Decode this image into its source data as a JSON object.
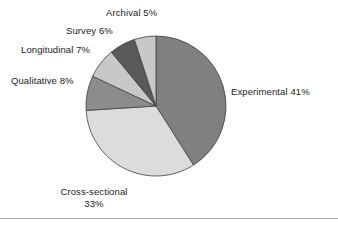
{
  "chart_data": {
    "type": "pie",
    "title": "",
    "categories": [
      "Experimental",
      "Cross-sectional",
      "Qualitative",
      "Longitudinal",
      "Survey",
      "Archival"
    ],
    "values": [
      41,
      33,
      8,
      7,
      6,
      5
    ],
    "unit": "%",
    "start_angle_deg": 0,
    "direction": "clockwise",
    "legend": "none",
    "grid": false,
    "slice_colors": [
      "#808080",
      "#dcdcdc",
      "#8c8c8c",
      "#c8c8c8",
      "#595959",
      "#c8c8c8"
    ],
    "slice_border_color": "#3f3f3f",
    "labels": [
      {
        "name": "experimental",
        "text": "Experimental 41%"
      },
      {
        "name": "cross-sectional",
        "line1": "Cross-sectional",
        "line2": "33%"
      },
      {
        "name": "qualitative",
        "text": "Qualitative 8%"
      },
      {
        "name": "longitudinal",
        "text": "Longitudinal 7%"
      },
      {
        "name": "survey",
        "text": "Survey 6%"
      },
      {
        "name": "archival",
        "text": "Archival 5%"
      }
    ]
  },
  "figure": {
    "background_color": "#ffffff",
    "rule_color": "#a8a8a8"
  }
}
